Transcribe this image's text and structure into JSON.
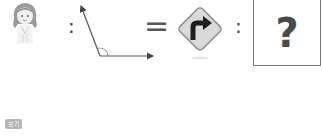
{
  "question": {
    "items": [
      {
        "type": "image",
        "icon": "girl-icon",
        "description": "cartoon girl with long hair"
      },
      {
        "type": "operator",
        "text": ":"
      },
      {
        "type": "image",
        "icon": "obtuse-angle-icon",
        "description": "angle formed by two rays with arc"
      },
      {
        "type": "operator",
        "text": "="
      },
      {
        "type": "image",
        "icon": "right-turn-sign-icon",
        "description": "diamond road sign with right turn arrow"
      },
      {
        "type": "operator",
        "text": ":"
      },
      {
        "type": "answer",
        "text": "?"
      }
    ],
    "colon_1": ":",
    "equals": "=",
    "colon_2": ":",
    "answer_placeholder": "?"
  },
  "footer": {
    "badge_label": "보기"
  },
  "colors": {
    "answer_border": "#777777",
    "question_mark": "#4a4a4a",
    "badge_bg": "#b4b4b4",
    "sign_fill": "#d8d8d8",
    "sign_border": "#8a8a8a",
    "arrow": "#222222"
  }
}
